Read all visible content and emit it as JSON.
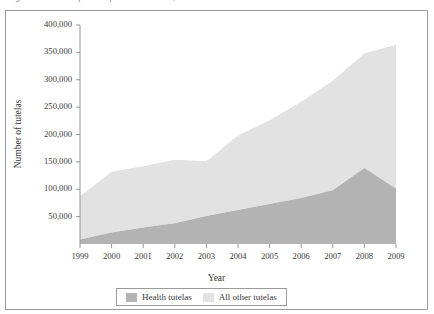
{
  "figure": {
    "caption_sliver": "Figure 1. Number of tutelas filed in Colombia, 1999–2009",
    "frame_visible": true
  },
  "chart_data": {
    "type": "area",
    "stacked": true,
    "title": "",
    "xlabel": "Year",
    "ylabel": "Number of tutelas",
    "categories": [
      "1999",
      "2000",
      "2001",
      "2002",
      "2003",
      "2004",
      "2005",
      "2006",
      "2007",
      "2008",
      "2009"
    ],
    "x": [
      1999,
      2000,
      2001,
      2002,
      2003,
      2004,
      2005,
      2006,
      2007,
      2008,
      2009
    ],
    "xlim": [
      1999,
      2009
    ],
    "ylim": [
      0,
      400000
    ],
    "yticks": [
      50000,
      100000,
      150000,
      200000,
      250000,
      300000,
      350000,
      400000
    ],
    "ytick_labels": [
      "50,000",
      "100,000",
      "150,000",
      "200,000",
      "250,000",
      "300,000",
      "350,000",
      "400,000"
    ],
    "xticks": [
      1999,
      2000,
      2001,
      2002,
      2003,
      2004,
      2005,
      2006,
      2007,
      2008,
      2009
    ],
    "grid": false,
    "legend_position": "bottom",
    "series": [
      {
        "name": "Health tutelas",
        "color": "#b3b3b3",
        "values": [
          8000,
          21000,
          30000,
          38000,
          51000,
          62000,
          73000,
          84000,
          98000,
          139000,
          101000
        ]
      },
      {
        "name": "All other tutelas",
        "color": "#e2e2e2",
        "values": [
          79000,
          111000,
          112000,
          116000,
          100000,
          136000,
          153000,
          176000,
          200000,
          209000,
          263000
        ]
      }
    ],
    "totals": [
      87000,
      132000,
      142000,
      154000,
      151000,
      198000,
      226000,
      260000,
      298000,
      348000,
      364000
    ]
  },
  "legend": {
    "entries": [
      {
        "label": "Health tutelas",
        "color": "#b3b3b3"
      },
      {
        "label": "All other tutelas",
        "color": "#e2e2e2"
      }
    ]
  },
  "colors": {
    "health": "#b3b3b3",
    "other": "#e2e2e2",
    "axis": "#8a8a8a",
    "frame": "#9a9a9a",
    "text": "#3a3a3a"
  }
}
